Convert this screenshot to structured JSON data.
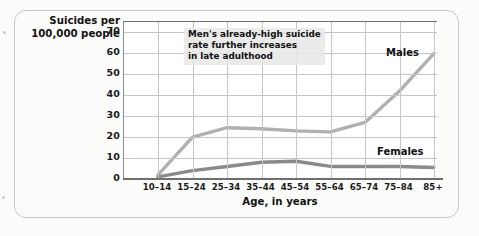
{
  "figure": {
    "y_axis_title": "Suicides per\n100,000 people",
    "x_axis_title": "Age, in years",
    "annotation": "Men's already-high suicide\nrate further increases\nin late adulthood",
    "label_males": "Males",
    "label_females": "Females"
  },
  "chart_data": {
    "type": "line",
    "title": "",
    "xlabel": "Age, in years",
    "ylabel": "Suicides per 100,000 people",
    "categories": [
      "10–14",
      "15–24",
      "25–34",
      "35–44",
      "45–54",
      "55–64",
      "65–74",
      "75–84",
      "85+"
    ],
    "ylim": [
      0,
      75
    ],
    "yticks": [
      0,
      10,
      20,
      30,
      40,
      50,
      60,
      70
    ],
    "ytick_labels": [
      "0",
      "10",
      "20",
      "30",
      "40",
      "50",
      "60",
      "70"
    ],
    "grid": "both",
    "legend": "inline-labels",
    "annotations": [
      {
        "text": "Men's already-high suicide rate further increases in late adulthood",
        "position": "top-center"
      }
    ],
    "series": [
      {
        "name": "Males",
        "color": "#b0b0b0",
        "values": [
          2,
          20,
          24.5,
          24,
          23,
          22.5,
          27,
          42,
          60
        ]
      },
      {
        "name": "Females",
        "color": "#8a8a8a",
        "values": [
          1,
          4,
          6,
          8,
          8.5,
          6,
          6,
          6,
          5.5
        ]
      }
    ]
  },
  "colors": {
    "males_line": "#b0b0b0",
    "females_line": "#8a8a8a",
    "gridline": "#c6c6c6",
    "axis": "#6f6f6f",
    "page_background": "#fbfbfa",
    "plot_background": "#ffffff"
  }
}
